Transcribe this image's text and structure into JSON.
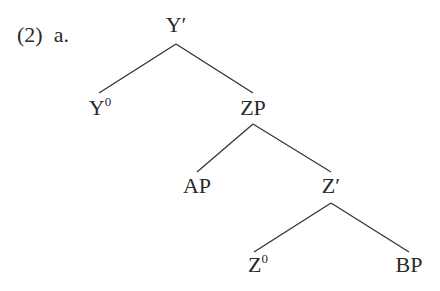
{
  "example": {
    "number": "(2)",
    "sub": "a."
  },
  "tree": {
    "nodes": {
      "y_bar": {
        "label": "Y′",
        "x": 176,
        "y": 12
      },
      "y_head": {
        "label": "Y",
        "sup": "0",
        "x": 100,
        "y": 95
      },
      "zp": {
        "label": "ZP",
        "x": 253,
        "y": 95
      },
      "ap": {
        "label": "AP",
        "x": 197,
        "y": 173
      },
      "z_bar": {
        "label": "Z′",
        "x": 331,
        "y": 173
      },
      "z_head": {
        "label": "Z",
        "sup": "0",
        "x": 256,
        "y": 252
      },
      "bp": {
        "label": "BP",
        "x": 409,
        "y": 252
      }
    },
    "edges": [
      {
        "from": "Y′",
        "to": "Y0"
      },
      {
        "from": "Y′",
        "to": "ZP"
      },
      {
        "from": "ZP",
        "to": "AP"
      },
      {
        "from": "ZP",
        "to": "Z′"
      },
      {
        "from": "Z′",
        "to": "Z0"
      },
      {
        "from": "Z′",
        "to": "BP"
      }
    ]
  }
}
